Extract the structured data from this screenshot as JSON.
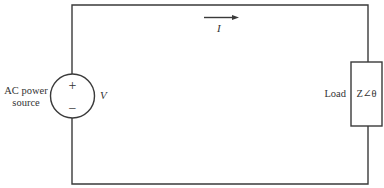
{
  "diagram": {
    "type": "circuit",
    "source": {
      "label_line1": "AC power",
      "label_line2": "source",
      "plus_symbol": "+",
      "minus_symbol": "−",
      "voltage_label": "V"
    },
    "current": {
      "label": "I",
      "direction": "right"
    },
    "load": {
      "label": "Load",
      "impedance": "Z∠θ"
    },
    "colors": {
      "line": "#3a3a3a",
      "text": "#333333",
      "background": "#ffffff"
    }
  }
}
